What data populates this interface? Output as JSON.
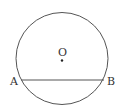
{
  "diagram": {
    "center_label": "O",
    "point_a_label": "A",
    "point_b_label": "B",
    "stroke_color": "#555555"
  }
}
